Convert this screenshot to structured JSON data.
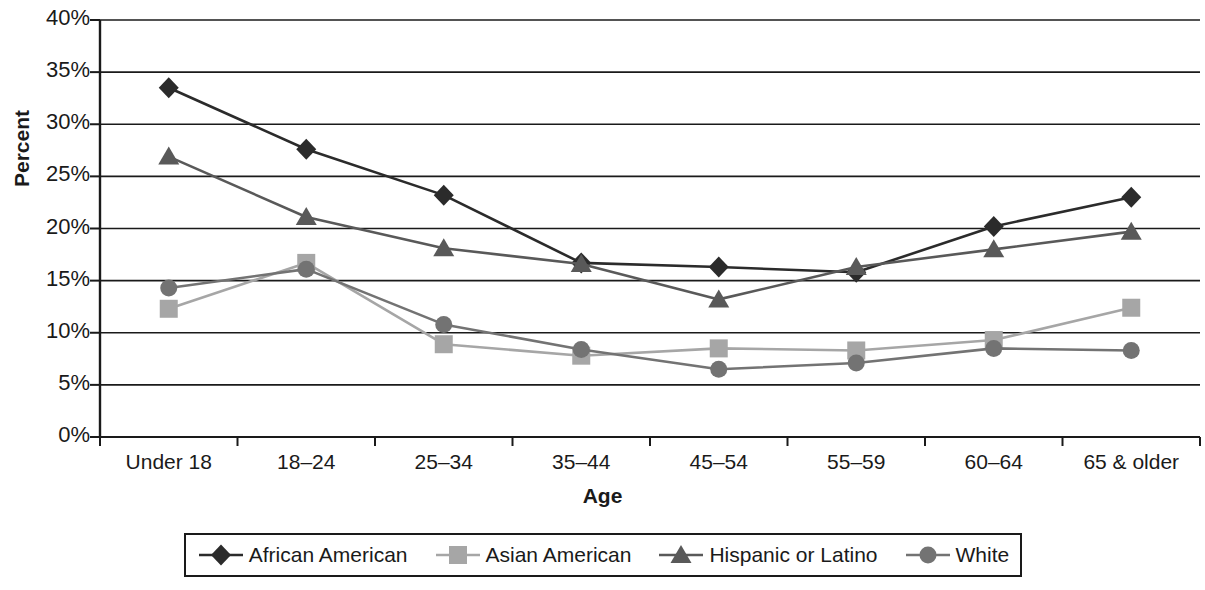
{
  "chart_data": {
    "type": "line",
    "title": "",
    "xlabel": "Age",
    "ylabel": "Percent",
    "categories": [
      "Under 18",
      "18–24",
      "25–34",
      "35–44",
      "45–54",
      "55–59",
      "60–64",
      "65 & older"
    ],
    "ylim": [
      0,
      40
    ],
    "ytick_values": [
      40,
      35,
      30,
      25,
      20,
      15,
      10,
      5,
      0
    ],
    "ytick_labels": [
      "40%",
      "35%",
      "30%",
      "25%",
      "20%",
      "15%",
      "10%",
      "5%",
      "0%"
    ],
    "grid": true,
    "grid_axis": "y",
    "legend_position": "bottom",
    "value_unit": "percent",
    "series": [
      {
        "name": "African American",
        "marker": "diamond",
        "color": "#2b2b2b",
        "line_color": "#2b2b2b",
        "values": [
          33.5,
          27.6,
          23.2,
          16.7,
          16.3,
          15.8,
          20.2,
          23.0
        ]
      },
      {
        "name": "Asian American",
        "marker": "square",
        "color": "#a6a6a6",
        "line_color": "#a6a6a6",
        "values": [
          12.3,
          16.7,
          8.9,
          7.8,
          8.5,
          8.3,
          9.3,
          12.4
        ]
      },
      {
        "name": "Hispanic or Latino",
        "marker": "triangle",
        "color": "#595959",
        "line_color": "#595959",
        "values": [
          26.9,
          21.1,
          18.1,
          16.6,
          13.2,
          16.3,
          18.0,
          19.7
        ]
      },
      {
        "name": "White",
        "marker": "circle",
        "color": "#737373",
        "line_color": "#737373",
        "values": [
          14.3,
          16.1,
          10.8,
          8.4,
          6.5,
          7.1,
          8.5,
          8.3
        ]
      }
    ]
  },
  "axes": {
    "axis_color": "#1a1a1a",
    "grid_color": "#1a1a1a",
    "background": "#ffffff"
  }
}
